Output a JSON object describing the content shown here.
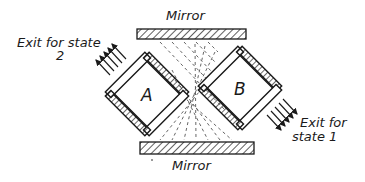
{
  "diagram": {
    "mirror_top": {
      "label": "Mirror"
    },
    "mirror_bottom": {
      "label": "Mirror"
    },
    "prism_a": {
      "label": "A"
    },
    "prism_b": {
      "label": "B"
    },
    "exit_state_2": {
      "line1": "Exit for state",
      "line2": "2"
    },
    "exit_state_1": {
      "line1": "Exit for",
      "line2": "state 1"
    },
    "colors": {
      "ink": "#1a1a1a",
      "background": "#ffffff"
    }
  }
}
